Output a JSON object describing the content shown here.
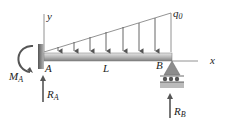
{
  "diagram": {
    "labels": {
      "y_axis": "y",
      "x_axis": "x",
      "load_intensity": "q",
      "load_intensity_sub": "0",
      "point_a": "A",
      "point_b": "B",
      "length": "L",
      "moment_a": "M",
      "moment_a_sub": "A",
      "reaction_a": "R",
      "reaction_a_sub": "A",
      "reaction_b": "R",
      "reaction_b_sub": "B"
    },
    "colors": {
      "beam": "#9a9a9a",
      "beam_highlight": "#d8d8d8",
      "wall": "#7a7a7a",
      "arrows": "#555555",
      "support": "#8c8c8c",
      "lines": "#777777"
    },
    "load": {
      "type": "triangular",
      "arrow_count": 7
    }
  }
}
